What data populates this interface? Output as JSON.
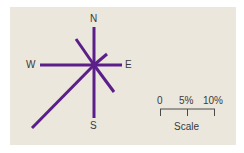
{
  "diagram": {
    "type": "wind-rose",
    "directions": {
      "north": "N",
      "south": "S",
      "east": "E",
      "west": "W"
    },
    "line_color": "#5b1f8a",
    "background": "#ece7dc",
    "rays": [
      {
        "direction": "N",
        "end": [
          94,
          27
        ]
      },
      {
        "direction": "NE",
        "end": [
          107,
          54
        ]
      },
      {
        "direction": "E",
        "end": [
          122,
          65
        ]
      },
      {
        "direction": "SE",
        "end": [
          114,
          92
        ]
      },
      {
        "direction": "S",
        "end": [
          94,
          118
        ]
      },
      {
        "direction": "SW",
        "end": [
          32,
          128
        ]
      },
      {
        "direction": "W",
        "end": [
          40,
          65
        ]
      },
      {
        "direction": "NW",
        "end": [
          76,
          39
        ]
      }
    ],
    "scale": {
      "ticks": [
        "0",
        "5%",
        "10%"
      ],
      "title": "Scale"
    }
  }
}
